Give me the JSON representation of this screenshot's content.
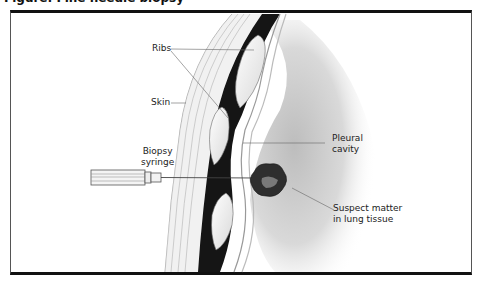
{
  "figure": {
    "title": "Figure: Fine needle biopsy",
    "labels": {
      "ribs": "Ribs",
      "skin": "Skin",
      "biopsy_syringe_line1": "Biopsy",
      "biopsy_syringe_line2": "syringe",
      "pleural_cavity_line1": "Pleural",
      "pleural_cavity_line2": "cavity",
      "suspect_matter_line1": "Suspect matter",
      "suspect_matter_line2": "in lung tissue"
    }
  }
}
